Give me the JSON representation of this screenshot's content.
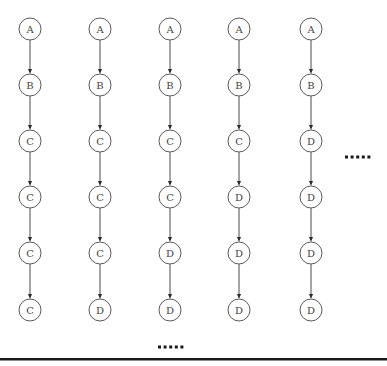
{
  "diagram": {
    "type": "sequence-chains",
    "layout": {
      "column_x": [
        30,
        100,
        170,
        239,
        311
      ],
      "row_y": [
        29,
        85,
        141,
        197,
        253,
        310
      ],
      "node_radius": 11
    },
    "chains": [
      {
        "id": "chain-1",
        "nodes": [
          "A",
          "B",
          "C",
          "C",
          "C",
          "C"
        ]
      },
      {
        "id": "chain-2",
        "nodes": [
          "A",
          "B",
          "C",
          "C",
          "C",
          "D"
        ]
      },
      {
        "id": "chain-3",
        "nodes": [
          "A",
          "B",
          "C",
          "C",
          "D",
          "D"
        ]
      },
      {
        "id": "chain-4",
        "nodes": [
          "A",
          "B",
          "C",
          "D",
          "D",
          "D"
        ]
      },
      {
        "id": "chain-5",
        "nodes": [
          "A",
          "B",
          "D",
          "D",
          "D",
          "D"
        ]
      }
    ],
    "ellipsis_right": {
      "text": ".....",
      "x": 345,
      "y": 157
    },
    "ellipsis_bottom": {
      "text": ".....",
      "x": 158,
      "y": 347
    },
    "colors": {
      "node_stroke": "#5a5a5a",
      "node_text": "#444444",
      "edge": "#4a4a4a",
      "rule": "#1a1a1a"
    }
  }
}
